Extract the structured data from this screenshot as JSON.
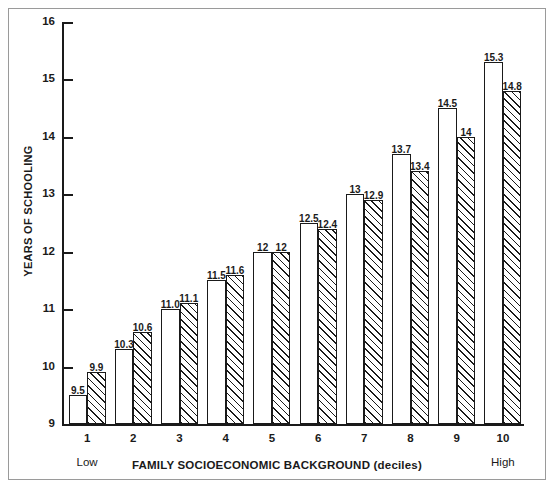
{
  "chart_data": {
    "type": "bar",
    "title": "",
    "xlabel": "FAMILY SOCIOECONOMIC BACKGROUND (deciles)",
    "ylabel": "YEARS OF SCHOOLING",
    "categories": [
      "1",
      "2",
      "3",
      "4",
      "5",
      "6",
      "7",
      "8",
      "9",
      "10"
    ],
    "category_end_labels": {
      "low": "Low",
      "high": "High"
    },
    "ylim": [
      9,
      16
    ],
    "yticks": [
      9,
      10,
      11,
      12,
      13,
      14,
      15,
      16
    ],
    "ytick_labels": [
      "9",
      "10",
      "11",
      "12",
      "13",
      "14",
      "15",
      "16"
    ],
    "grid": false,
    "legend": "none",
    "series": [
      {
        "name": "series-a",
        "fill": "white",
        "values": [
          9.5,
          10.3,
          11.0,
          11.5,
          12.0,
          12.5,
          13.0,
          13.7,
          14.5,
          15.3
        ],
        "labels": [
          "9.5",
          "10.3",
          "11.0",
          "11.5",
          "12",
          "12.5",
          "13",
          "13.7",
          "14.5",
          "15.3"
        ]
      },
      {
        "name": "series-b",
        "fill": "hatched",
        "values": [
          9.9,
          10.6,
          11.1,
          11.6,
          12.0,
          12.4,
          12.9,
          13.4,
          14.0,
          14.8
        ],
        "labels": [
          "9.9",
          "10.6",
          "11.1",
          "11.6",
          "12",
          "12.4",
          "12.9",
          "13.4",
          "14",
          "14.8"
        ]
      }
    ]
  },
  "colors": {
    "axis": "#1a1a1a",
    "frame": "#9a9a9a",
    "bar_fill": "#ffffff",
    "hatch": "#1a1a1a",
    "background": "#ffffff"
  }
}
